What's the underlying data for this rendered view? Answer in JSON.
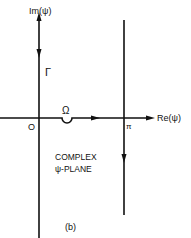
{
  "figure": {
    "subfigure_label": "(b)",
    "axes": {
      "imag_label": "Im(ψ)",
      "real_label": "Re(ψ)",
      "origin_label": "O"
    },
    "contour": {
      "gamma_label": "Γ",
      "omega_label": "Ω",
      "pi_label": "π"
    },
    "plane_caption": {
      "line1": "COMPLEX",
      "line2": "ψ-PLANE"
    },
    "colors": {
      "ink": "#111111",
      "background": "#ffffff"
    }
  }
}
